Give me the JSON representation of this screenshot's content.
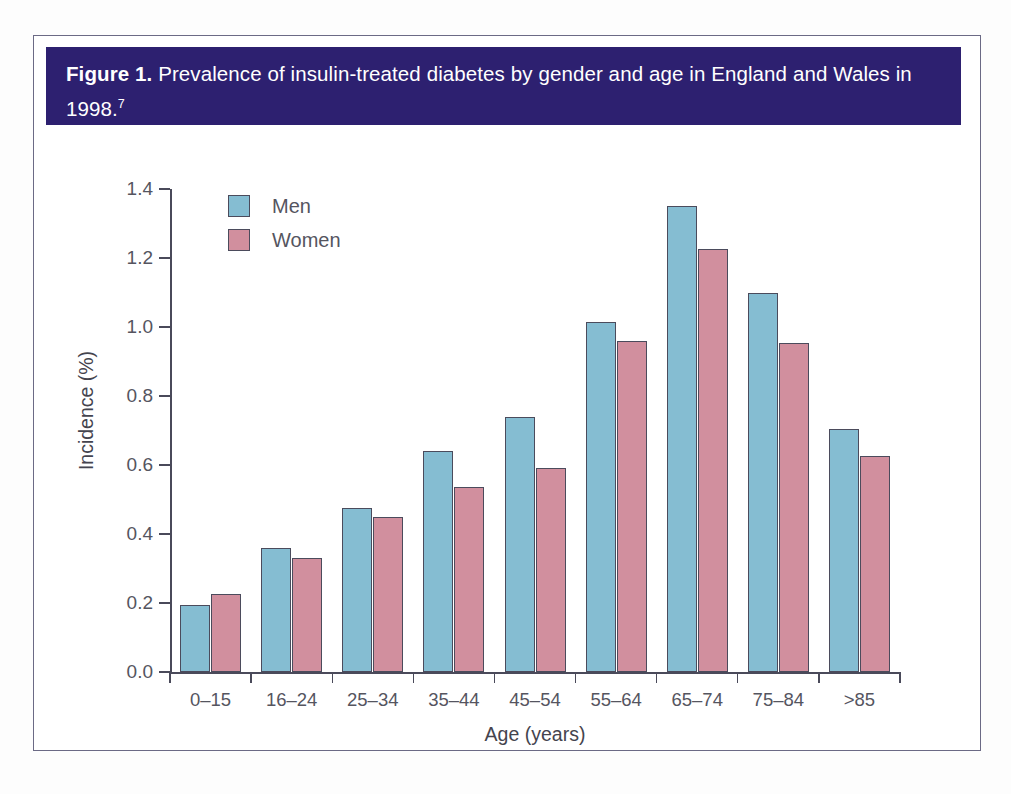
{
  "figure": {
    "number_label": "Figure 1.",
    "caption": "Prevalence of insulin-treated diabetes by gender and age in England and Wales in 1998.",
    "reference_superscript": "7"
  },
  "chart_data": {
    "type": "bar",
    "title": "Prevalence of insulin-treated diabetes by gender and age in England and Wales in 1998",
    "xlabel": "Age (years)",
    "ylabel": "Incidence (%)",
    "ylim": [
      0.0,
      1.4
    ],
    "yticks": [
      "0.0",
      "0.2",
      "0.4",
      "0.6",
      "0.8",
      "1.0",
      "1.2",
      "1.4"
    ],
    "ytick_values": [
      0.0,
      0.2,
      0.4,
      0.6,
      0.8,
      1.0,
      1.2,
      1.4
    ],
    "grid": false,
    "legend_position": "top-left",
    "categories": [
      "0–15",
      "16–24",
      "25–34",
      "35–44",
      "45–54",
      "55–64",
      "65–74",
      "75–84",
      ">85"
    ],
    "series": [
      {
        "name": "Men",
        "color": "#85bdd2",
        "values": [
          0.195,
          0.36,
          0.475,
          0.64,
          0.74,
          1.015,
          1.35,
          1.1,
          0.705
        ]
      },
      {
        "name": "Women",
        "color": "#d18f9e",
        "values": [
          0.225,
          0.33,
          0.45,
          0.535,
          0.59,
          0.96,
          1.225,
          0.955,
          0.625
        ]
      }
    ]
  },
  "colors": {
    "header_background": "#2d2070",
    "header_text": "#ffffff",
    "frame_border": "#6b6a85",
    "axis": "#4a4a5a",
    "men": "#85bdd2",
    "women": "#d18f9e",
    "bar_outline": "#4b4b5c"
  }
}
